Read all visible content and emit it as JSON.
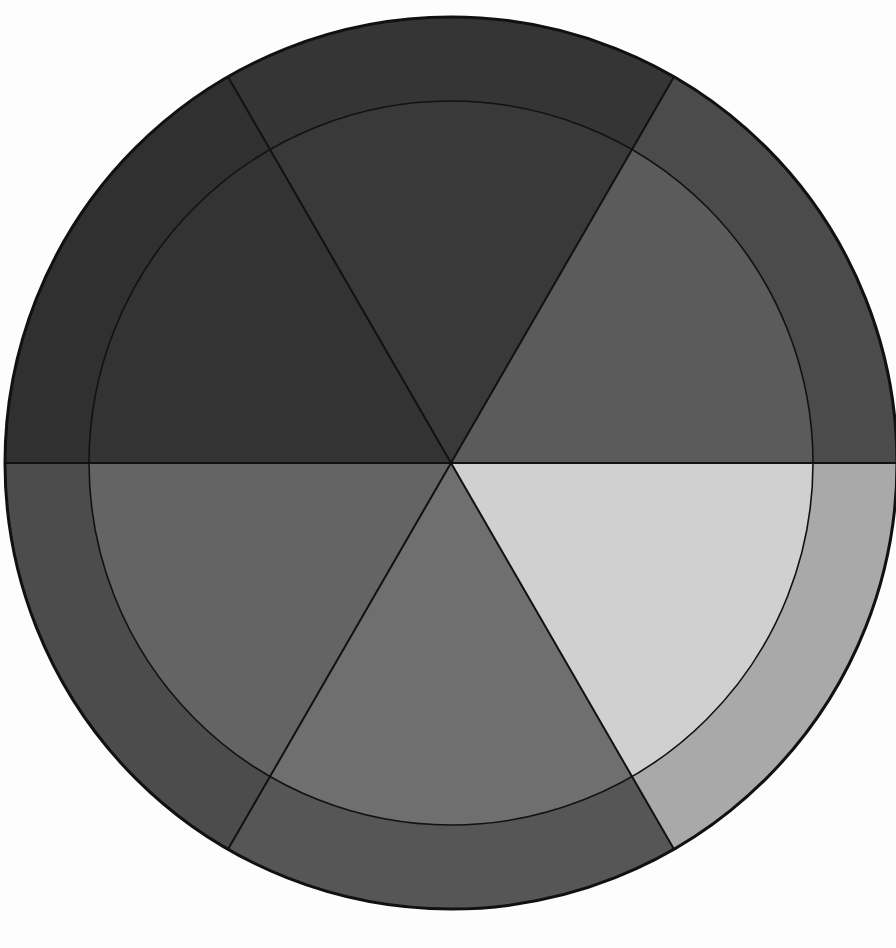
{
  "diagram": {
    "type": "segmented-color-wheel",
    "center": [
      451,
      463
    ],
    "outer_radius": 446,
    "inner_radius": 362,
    "segments": [
      {
        "name": "segment-upper-right",
        "start_deg": 0,
        "end_deg": 60,
        "outer_color": "#4b4b4b",
        "inner_color": "#5b5b5b"
      },
      {
        "name": "segment-top",
        "start_deg": 60,
        "end_deg": 120,
        "outer_color": "#353535",
        "inner_color": "#393939"
      },
      {
        "name": "segment-upper-left",
        "start_deg": 120,
        "end_deg": 180,
        "outer_color": "#303030",
        "inner_color": "#333333"
      },
      {
        "name": "segment-lower-left",
        "start_deg": 180,
        "end_deg": 240,
        "outer_color": "#4c4c4c",
        "inner_color": "#646464"
      },
      {
        "name": "segment-bottom",
        "start_deg": 240,
        "end_deg": 300,
        "outer_color": "#565656",
        "inner_color": "#6f6f6f"
      },
      {
        "name": "segment-lower-right",
        "start_deg": 300,
        "end_deg": 360,
        "outer_color": "#a9a9a9",
        "inner_color": "#d0d0d0"
      }
    ],
    "divider_color": "#111111",
    "background": "#fdfdfd"
  }
}
